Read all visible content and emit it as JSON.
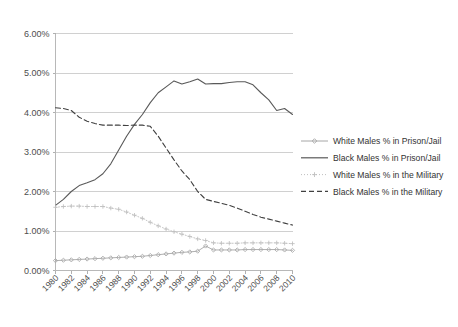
{
  "chart_data": {
    "type": "line",
    "title": "",
    "subtitle": "",
    "xlabel": "",
    "ylabel": "",
    "grid": true,
    "legend_position": "right",
    "xlim": [
      1980,
      2010
    ],
    "ylim": [
      0,
      6
    ],
    "y_tick_labels": [
      "6.00%",
      "5.00%",
      "4.00%",
      "3.00%",
      "2.00%",
      "1.00%",
      "0.00%"
    ],
    "y_tick_values": [
      6,
      5,
      4,
      3,
      2,
      1,
      0
    ],
    "x_tick_labels": [
      "1980",
      "1982",
      "1984",
      "1986",
      "1988",
      "1990",
      "1992",
      "1994",
      "1996",
      "1998",
      "2000",
      "2002",
      "2004",
      "2006",
      "2008",
      "2010"
    ],
    "x_tick_values": [
      1980,
      1982,
      1984,
      1986,
      1988,
      1990,
      1992,
      1994,
      1996,
      1998,
      2000,
      2002,
      2004,
      2006,
      2008,
      2010
    ],
    "x": [
      1980,
      1981,
      1982,
      1983,
      1984,
      1985,
      1986,
      1987,
      1988,
      1989,
      1990,
      1991,
      1992,
      1993,
      1994,
      1995,
      1996,
      1997,
      1998,
      1999,
      2000,
      2001,
      2002,
      2003,
      2004,
      2005,
      2006,
      2007,
      2008,
      2009,
      2010
    ],
    "series": [
      {
        "name": "White Males % in Prison/Jail",
        "color": "#a6a6a6",
        "line_style": "solid",
        "marker": "diamond",
        "values": [
          0.25,
          0.26,
          0.27,
          0.28,
          0.29,
          0.3,
          0.31,
          0.32,
          0.33,
          0.34,
          0.35,
          0.36,
          0.38,
          0.4,
          0.42,
          0.44,
          0.46,
          0.47,
          0.49,
          0.62,
          0.52,
          0.52,
          0.52,
          0.52,
          0.53,
          0.53,
          0.53,
          0.53,
          0.53,
          0.52,
          0.51
        ]
      },
      {
        "name": "Black Males % in Prison/Jail",
        "color": "#595959",
        "line_style": "solid",
        "marker": "none",
        "values": [
          1.65,
          1.8,
          2.0,
          2.15,
          2.22,
          2.3,
          2.45,
          2.7,
          3.05,
          3.4,
          3.7,
          3.95,
          4.25,
          4.5,
          4.65,
          4.8,
          4.72,
          4.78,
          4.85,
          4.72,
          4.73,
          4.73,
          4.76,
          4.78,
          4.78,
          4.7,
          4.5,
          4.32,
          4.05,
          4.1,
          3.95
        ]
      },
      {
        "name": "White Males % in the Military",
        "color": "#bfbfbf",
        "line_style": "dotted",
        "marker": "plus",
        "values": [
          1.6,
          1.62,
          1.63,
          1.63,
          1.62,
          1.62,
          1.62,
          1.58,
          1.55,
          1.48,
          1.4,
          1.32,
          1.22,
          1.13,
          1.05,
          0.98,
          0.92,
          0.86,
          0.8,
          0.76,
          0.7,
          0.69,
          0.69,
          0.69,
          0.7,
          0.7,
          0.7,
          0.7,
          0.7,
          0.69,
          0.68
        ]
      },
      {
        "name": "Black Males % in the Military",
        "color": "#404040",
        "line_style": "dashed",
        "marker": "none",
        "values": [
          4.12,
          4.1,
          4.05,
          3.88,
          3.78,
          3.72,
          3.68,
          3.68,
          3.68,
          3.67,
          3.68,
          3.68,
          3.65,
          3.4,
          3.1,
          2.8,
          2.52,
          2.3,
          2.0,
          1.8,
          1.75,
          1.7,
          1.65,
          1.58,
          1.5,
          1.42,
          1.35,
          1.3,
          1.25,
          1.2,
          1.15
        ]
      }
    ]
  },
  "legend": {
    "entries": [
      {
        "label": "White Males % in Prison/Jail"
      },
      {
        "label": "Black Males % in Prison/Jail"
      },
      {
        "label": "White Males % in the Military"
      },
      {
        "label": "Black Males % in the Military"
      }
    ]
  }
}
